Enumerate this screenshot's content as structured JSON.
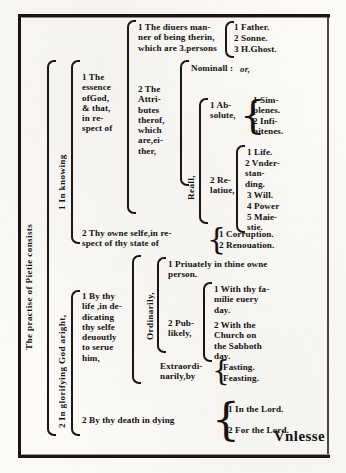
{
  "document": {
    "title": "The practise of Pietie consists",
    "catchword": "Vnlesse",
    "type": "bracket-diagram",
    "era": "early-modern-english-blackletter-roman"
  },
  "root": {
    "label": "The practise of Pietie consists",
    "orientation": "vertical"
  },
  "branches": {
    "knowing": {
      "label": "1 In knowing",
      "children": {
        "essence": {
          "label": "1 The\nessence\nofGod,\n& that,\nin re-\nspect of",
          "children": {
            "persons": {
              "label": "1 The diuers man-\nner of being therin,\nwhich are 3.persons",
              "items": [
                "1 Father.",
                "2 Sonne.",
                "3 H.Ghost."
              ]
            },
            "attributes": {
              "label": "2 The\nAttri-\nbutes\ntherof,\nwhich\nare,ei-\nther,",
              "kinds": {
                "nominal": {
                  "label": "Nominall :",
                  "connector": "or,"
                },
                "real": {
                  "label": "Reall,",
                  "children": [
                    {
                      "label": "1 Ab-\nsolute,",
                      "items": [
                        "1 Sim-\nplenes.",
                        "2 Infi-\nnitenes."
                      ]
                    },
                    {
                      "label": "2 Re-\nlatiue,",
                      "items": [
                        "1 Life.",
                        "2 Vnder-\nstan-\nding.",
                        "3 Will.",
                        "4 Power",
                        "5 Maie-\nstie."
                      ]
                    }
                  ]
                }
              }
            }
          }
        },
        "selfe": {
          "label": "2 Thy owne selfe,in re-\nspect of thy state of",
          "items": [
            "1 Corruption.",
            "2 Renouation."
          ]
        }
      }
    },
    "glorifying": {
      "label": "2 In glorifying God aright,",
      "children": {
        "life": {
          "label": "1 By thy\nlife ,in de-\ndicating\nthy selfe\ndeuoutly\nto serue\nhim,",
          "modes": {
            "ordinarily": {
              "label": "Ordinarily,",
              "items": [
                {
                  "label": "1 Priuately in thine owne\nperson.",
                  "items": []
                },
                {
                  "label": "2 Pub-\nlikely,",
                  "items": [
                    "1 With thy fa-\nmilie euery\nday.",
                    "2 With the\nChurch on\nthe Sabboth\nday."
                  ]
                }
              ]
            },
            "extraordinarily": {
              "label": "Extraordi-\nnarily,by",
              "items": [
                "Fasting.",
                "Feasting."
              ]
            }
          }
        },
        "death": {
          "label": "2 By thy death in dying",
          "items": [
            "1 In the Lord.",
            "2 For the Lord."
          ]
        }
      }
    }
  }
}
